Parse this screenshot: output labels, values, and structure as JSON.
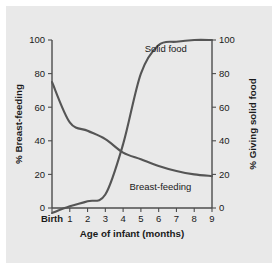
{
  "figure": {
    "background": "#ffffff",
    "panel_background": "#e9e9e9",
    "curve_color": "#555555",
    "axis_color": "#4d4d4d"
  },
  "chart_data": {
    "type": "line",
    "title": "",
    "xlabel": "Age of infant (months)",
    "x_tick_labels": [
      "Birth",
      "1",
      "2",
      "3",
      "4",
      "5",
      "6",
      "7",
      "8",
      "9"
    ],
    "x": [
      0,
      1,
      2,
      3,
      4,
      5,
      6,
      7,
      8,
      9
    ],
    "xlim": [
      0,
      9
    ],
    "grid": false,
    "legend_position": "inline-labels",
    "axes": [
      {
        "side": "left",
        "label": "% Breast-feeding",
        "ticks": [
          0,
          20,
          40,
          60,
          80,
          100
        ],
        "tick_labels": [
          "0",
          "20",
          "40",
          "60",
          "80",
          "100"
        ],
        "ylim": [
          0,
          100
        ]
      },
      {
        "side": "right",
        "label": "% Giving solid food",
        "ticks": [
          0,
          20,
          40,
          60,
          80,
          100
        ],
        "tick_labels": [
          "0",
          "20",
          "40",
          "60",
          "80",
          "100"
        ],
        "ylim": [
          0,
          100
        ]
      }
    ],
    "series": [
      {
        "name": "Breast-feeding",
        "axis": "left",
        "annotation": "Breast-feeding",
        "annotation_x": 6.1,
        "annotation_y": 11,
        "values": [
          75,
          51,
          46,
          41,
          33,
          29,
          25,
          22,
          20,
          19
        ]
      },
      {
        "name": "Solid food",
        "axis": "right",
        "annotation": "Solid food",
        "annotation_x": 6.4,
        "annotation_y": 93,
        "values": [
          -3,
          1,
          4,
          8,
          38,
          80,
          97,
          99,
          100,
          100
        ]
      }
    ]
  }
}
